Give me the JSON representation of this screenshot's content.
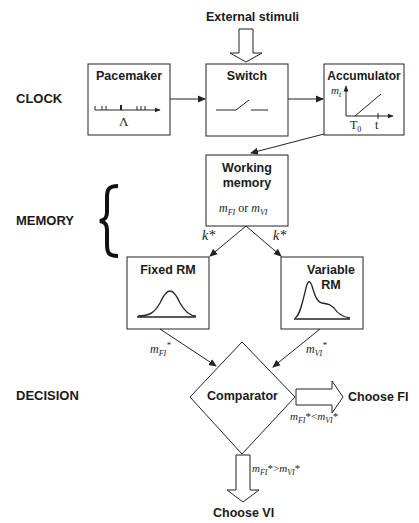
{
  "title": "",
  "stages": {
    "clock": "CLOCK",
    "memory": "MEMORY",
    "decision": "DECISION"
  },
  "nodes": {
    "external_stimuli": "External stimuli",
    "pacemaker": {
      "label": "Pacemaker",
      "symbol": "Λ"
    },
    "switch": {
      "label": "Switch"
    },
    "accumulator": {
      "label": "Accumulator",
      "y_axis": "m",
      "y_axis_sub": "t",
      "x_tick_1": "T",
      "x_tick_1_sub": "0",
      "x_tick_2": "t"
    },
    "working_memory": {
      "label_line1": "Working",
      "label_line2": "memory",
      "content_a": "m",
      "content_a_sub": "FI",
      "content_or": "or",
      "content_b": "m",
      "content_b_sub": "VI"
    },
    "fixed_rm": {
      "label": "Fixed RM"
    },
    "variable_rm": {
      "label_line1": "Variable",
      "label_line2": "RM"
    },
    "comparator": {
      "label": "Comparator"
    }
  },
  "edges": {
    "k_left": "k*",
    "k_right": "k*",
    "m_fi_star": {
      "base": "m",
      "sub": "FI",
      "sup": "*"
    },
    "m_vi_star": {
      "base": "m",
      "sub": "VI",
      "sup": "*"
    },
    "cond_fi": {
      "lhs": "m",
      "lhs_sub": "FI",
      "op": "*<",
      "rhs": "m",
      "rhs_sub": "VI",
      "tail": "*"
    },
    "cond_vi": {
      "lhs": "m",
      "lhs_sub": "FI",
      "op": "*>",
      "rhs": "m",
      "rhs_sub": "VI",
      "tail": "*"
    }
  },
  "outcomes": {
    "choose_fi": "Choose FI",
    "choose_vi": "Choose VI"
  },
  "colors": {
    "stroke": "#222222",
    "background": "#ffffff"
  }
}
